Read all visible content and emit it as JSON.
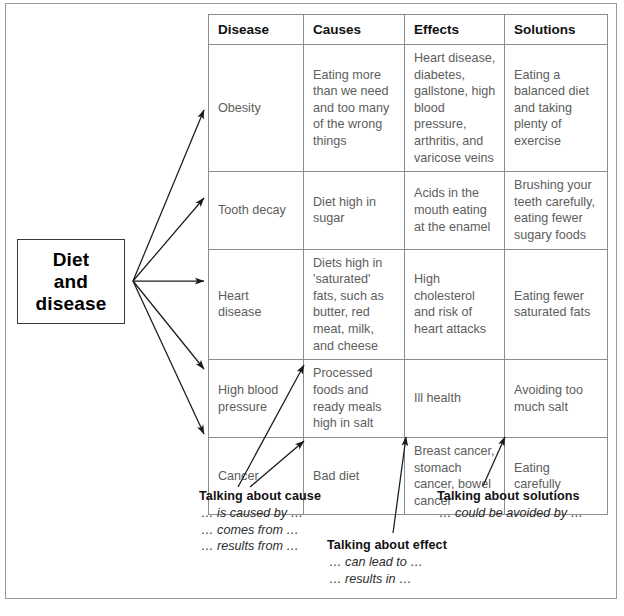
{
  "source_box": {
    "label": "Diet\nand\ndisease",
    "line1": "Diet",
    "line2": "and",
    "line3": "disease"
  },
  "table": {
    "headers": [
      "Disease",
      "Causes",
      "Effects",
      "Solutions"
    ],
    "rows": [
      {
        "disease": "Obesity",
        "causes": "Eating more than we need and too many of the wrong things",
        "effects": "Heart disease, diabetes, gallstone, high blood pressure, arthritis, and varicose veins",
        "solutions": "Eating a balanced diet and taking plenty of exercise"
      },
      {
        "disease": "Tooth decay",
        "causes": "Diet high in sugar",
        "effects": "Acids in the mouth eating at the enamel",
        "solutions": "Brushing your teeth carefully, eating fewer sugary foods"
      },
      {
        "disease": "Heart disease",
        "causes": "Diets high in 'saturated' fats, such as butter, red meat, milk, and cheese",
        "effects": "High cholesterol and risk of heart attacks",
        "solutions": "Eating fewer saturated fats"
      },
      {
        "disease": "High blood pressure",
        "causes": "Processed foods and ready meals high in salt",
        "effects": "Ill health",
        "solutions": "Avoiding too much salt"
      },
      {
        "disease": "Cancer",
        "causes": "Bad diet",
        "effects": "Breast cancer, stomach cancer, bowel cancer",
        "solutions": "Eating carefully"
      }
    ]
  },
  "notes": {
    "cause": {
      "title": "Talking about cause",
      "phrases": [
        "… is caused by …",
        "… comes from …",
        "… results from …"
      ]
    },
    "effect": {
      "title": "Talking about effect",
      "phrases": [
        "… can lead to …",
        "… results in …"
      ]
    },
    "solutions": {
      "title": "Talking about solutions",
      "phrases": [
        "… could be avoided by …"
      ]
    }
  },
  "colors": {
    "frame": "#9a9a9a",
    "table_border": "#8d8d8d",
    "cell_text": "#5d5d5d",
    "header_text": "#111111",
    "arrow": "#1a1a1a"
  }
}
